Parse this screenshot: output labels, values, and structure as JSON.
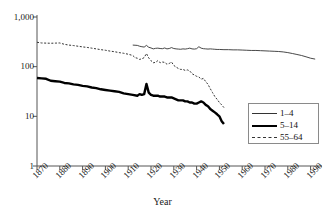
{
  "chart_data": {
    "type": "line",
    "title": "",
    "xlabel": "Year",
    "ylabel": "",
    "yscale": "log",
    "ylim": [
      1,
      1000
    ],
    "xlim": [
      1870,
      1995
    ],
    "grid": false,
    "legend_position": "bottom-right",
    "ytick_labels": [
      "1,000",
      "100",
      "10",
      "1"
    ],
    "ytick_values": [
      1000,
      100,
      10,
      1
    ],
    "xtick_labels": [
      "1870",
      "1880",
      "1890",
      "1900",
      "1910",
      "1920",
      "1930",
      "1940",
      "1950",
      "1960",
      "1970",
      "1980",
      "1990"
    ],
    "xtick_values": [
      1870,
      1880,
      1890,
      1900,
      1910,
      1920,
      1930,
      1940,
      1950,
      1960,
      1970,
      1980,
      1990
    ],
    "series": [
      {
        "name": "1-4",
        "style": "thin-solid",
        "color": "#333333",
        "x": [
          1912,
          1913,
          1914,
          1915,
          1916,
          1917,
          1918,
          1919,
          1920,
          1921,
          1922,
          1923,
          1924,
          1925,
          1926,
          1927,
          1928,
          1929,
          1930,
          1931,
          1932,
          1933,
          1934,
          1935,
          1936,
          1937,
          1938,
          1939,
          1940,
          1941,
          1942,
          1943,
          1944,
          1945,
          1946,
          1947,
          1948,
          1949,
          1950,
          1952,
          1954,
          1956,
          1958,
          1960,
          1962,
          1964,
          1966,
          1968,
          1970,
          1972,
          1974,
          1976,
          1978,
          1980,
          1982,
          1984,
          1986,
          1988,
          1990,
          1992
        ],
        "y": [
          272,
          270,
          268,
          258,
          252,
          248,
          268,
          246,
          238,
          228,
          234,
          236,
          232,
          230,
          238,
          228,
          232,
          242,
          232,
          228,
          226,
          224,
          228,
          226,
          230,
          236,
          228,
          226,
          230,
          252,
          236,
          230,
          228,
          226,
          228,
          226,
          224,
          222,
          222,
          220,
          220,
          218,
          218,
          216,
          214,
          212,
          212,
          210,
          208,
          206,
          204,
          202,
          198,
          192,
          184,
          176,
          168,
          158,
          148,
          142
        ]
      },
      {
        "name": "5-14",
        "style": "thick-solid",
        "color": "#000000",
        "x": [
          1870,
          1872,
          1874,
          1876,
          1878,
          1880,
          1882,
          1884,
          1886,
          1888,
          1890,
          1892,
          1894,
          1896,
          1898,
          1900,
          1902,
          1904,
          1906,
          1908,
          1910,
          1912,
          1914,
          1915,
          1916,
          1917,
          1918,
          1919,
          1920,
          1921,
          1922,
          1923,
          1924,
          1925,
          1926,
          1927,
          1928,
          1929,
          1930,
          1931,
          1932,
          1933,
          1934,
          1935,
          1936,
          1937,
          1938,
          1939,
          1940,
          1941,
          1942,
          1943,
          1944,
          1945,
          1946,
          1947,
          1948,
          1949,
          1950,
          1951,
          1952
        ],
        "y": [
          59,
          58,
          57,
          52,
          51,
          50,
          47,
          46,
          44,
          43,
          41,
          40,
          38,
          37,
          35,
          34,
          33,
          32,
          31,
          29,
          28,
          27,
          26,
          28,
          27,
          28,
          45,
          30,
          27,
          26,
          26,
          26,
          25,
          25,
          25,
          24,
          24,
          24,
          23,
          22,
          21,
          21,
          21,
          20,
          20,
          19,
          19,
          18,
          18,
          19,
          20,
          19,
          17,
          16,
          14,
          13,
          12,
          11,
          10,
          8,
          7
        ]
      },
      {
        "name": "55-64",
        "style": "dashed",
        "color": "#333333",
        "x": [
          1870,
          1872,
          1874,
          1876,
          1878,
          1880,
          1882,
          1884,
          1886,
          1888,
          1890,
          1892,
          1894,
          1896,
          1898,
          1900,
          1902,
          1904,
          1906,
          1908,
          1910,
          1912,
          1913,
          1914,
          1915,
          1916,
          1917,
          1918,
          1919,
          1920,
          1921,
          1922,
          1923,
          1924,
          1925,
          1926,
          1927,
          1928,
          1929,
          1930,
          1931,
          1932,
          1933,
          1934,
          1935,
          1936,
          1937,
          1938,
          1939,
          1940,
          1941,
          1942,
          1943,
          1944,
          1945,
          1946,
          1947,
          1948,
          1949,
          1950,
          1951,
          1952
        ],
        "y": [
          310,
          300,
          298,
          296,
          298,
          300,
          282,
          272,
          266,
          258,
          250,
          244,
          236,
          228,
          220,
          214,
          206,
          200,
          192,
          186,
          178,
          168,
          152,
          148,
          140,
          144,
          152,
          184,
          150,
          132,
          120,
          122,
          132,
          120,
          124,
          122,
          112,
          116,
          124,
          106,
          98,
          92,
          88,
          88,
          84,
          86,
          82,
          72,
          68,
          64,
          62,
          56,
          58,
          50,
          44,
          36,
          30,
          25,
          22,
          19,
          17,
          15
        ]
      }
    ]
  },
  "axis": {
    "x_title": "Year"
  },
  "legend": {
    "entries": [
      {
        "label": "1–4"
      },
      {
        "label": "5–14"
      },
      {
        "label": "55–64"
      }
    ]
  }
}
